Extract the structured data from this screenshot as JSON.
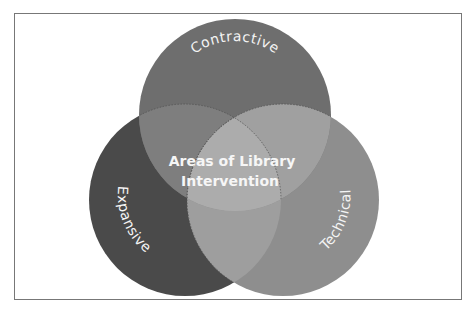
{
  "diagram": {
    "type": "venn",
    "center_label_line1": "Areas of Library",
    "center_label_line2": "Intervention",
    "sets": [
      {
        "id": "contractive",
        "label": "Contractive",
        "color": "#6e6e6e"
      },
      {
        "id": "expansive",
        "label": "Expansive",
        "color": "#4a4a4a"
      },
      {
        "id": "technical",
        "label": "Technical",
        "color": "#8e8e8e"
      }
    ],
    "overlap_colors": {
      "contractive_expansive": "#7e7e7e",
      "contractive_technical": "#a0a0a0",
      "expansive_technical": "#9e9e9e",
      "all_three": "#acacac"
    },
    "frame_color": "#777777"
  }
}
